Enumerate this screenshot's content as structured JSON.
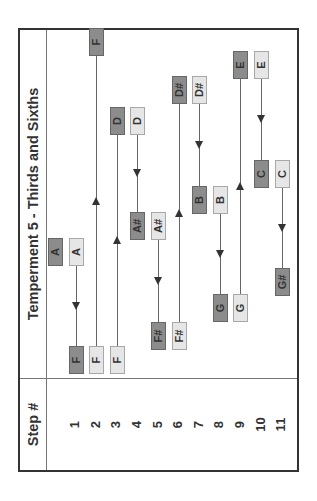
{
  "title": "Temperment 5 - Thirds and Sixths",
  "steps_header": "Step #",
  "steps": [
    "1",
    "2",
    "3",
    "4",
    "5",
    "6",
    "7",
    "8",
    "9",
    "10",
    "11"
  ],
  "colors": {
    "dark_box": "#8c8c8c",
    "light_box": "#e6e6e6",
    "line": "#666666",
    "border": "#333333"
  },
  "initial": {
    "note": "A",
    "style": "dark"
  },
  "moves": [
    {
      "step": "1",
      "from": "A",
      "to": "F",
      "direction": "down"
    },
    {
      "step": "2",
      "from": "F",
      "to": "F",
      "direction": "up"
    },
    {
      "step": "3",
      "from": "F",
      "to": "D",
      "direction": "up"
    },
    {
      "step": "4",
      "from": "D",
      "to": "A#",
      "direction": "down"
    },
    {
      "step": "5",
      "from": "A#",
      "to": "F#",
      "direction": "down"
    },
    {
      "step": "6",
      "from": "F#",
      "to": "D#",
      "direction": "up"
    },
    {
      "step": "7",
      "from": "D#",
      "to": "B",
      "direction": "down"
    },
    {
      "step": "8",
      "from": "B",
      "to": "G",
      "direction": "down"
    },
    {
      "step": "9",
      "from": "G",
      "to": "E",
      "direction": "up"
    },
    {
      "step": "10",
      "from": "E",
      "to": "C",
      "direction": "down"
    },
    {
      "step": "11",
      "from": "C",
      "to": "G#",
      "direction": "down"
    }
  ]
}
